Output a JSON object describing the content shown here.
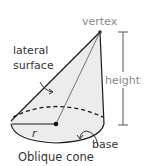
{
  "figure": {
    "caption": "Oblique cone",
    "labels": {
      "vertex": "vertex",
      "lateral_surface_line1": "lateral",
      "lateral_surface_line2": "surface",
      "height": "height",
      "radius": "r",
      "base": "base"
    },
    "colors": {
      "fill": "#ececec",
      "stroke": "#1a1a1a",
      "annotation": "#8a8a8a"
    }
  }
}
